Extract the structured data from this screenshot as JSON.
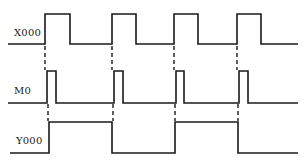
{
  "diagram": {
    "type": "timing-diagram",
    "colors": {
      "line": "#1a1a1a",
      "background": "#ffffff"
    },
    "signals": [
      {
        "name": "X000",
        "label_pos": [
          14,
          34
        ],
        "low_y": 44,
        "high_y": 14,
        "path": [
          [
            8,
            44
          ],
          [
            45,
            44
          ],
          [
            45,
            14
          ],
          [
            70,
            14
          ],
          [
            70,
            44
          ],
          [
            112,
            44
          ],
          [
            112,
            14
          ],
          [
            136,
            14
          ],
          [
            136,
            44
          ],
          [
            174,
            44
          ],
          [
            174,
            14
          ],
          [
            198,
            14
          ],
          [
            198,
            44
          ],
          [
            237,
            44
          ],
          [
            237,
            14
          ],
          [
            261,
            14
          ],
          [
            261,
            44
          ],
          [
            298,
            44
          ]
        ]
      },
      {
        "name": "M0",
        "label_pos": [
          14,
          92
        ],
        "low_y": 103,
        "high_y": 71,
        "path": [
          [
            8,
            103
          ],
          [
            47,
            103
          ],
          [
            47,
            71
          ],
          [
            56,
            71
          ],
          [
            56,
            103
          ],
          [
            114,
            103
          ],
          [
            114,
            71
          ],
          [
            123,
            71
          ],
          [
            123,
            103
          ],
          [
            176,
            103
          ],
          [
            176,
            71
          ],
          [
            184,
            71
          ],
          [
            184,
            103
          ],
          [
            239,
            103
          ],
          [
            239,
            71
          ],
          [
            248,
            71
          ],
          [
            248,
            103
          ],
          [
            298,
            103
          ]
        ]
      },
      {
        "name": "Y000",
        "label_pos": [
          16,
          142
        ],
        "low_y": 153,
        "high_y": 122,
        "path": [
          [
            10,
            153
          ],
          [
            49,
            153
          ],
          [
            49,
            122
          ],
          [
            112,
            122
          ],
          [
            112,
            153
          ],
          [
            175,
            153
          ],
          [
            175,
            122
          ],
          [
            238,
            122
          ],
          [
            238,
            153
          ],
          [
            298,
            153
          ]
        ]
      }
    ],
    "dashed_guides": [
      {
        "x": 45,
        "y1": 46,
        "y2": 70
      },
      {
        "x": 112,
        "y1": 46,
        "y2": 70
      },
      {
        "x": 174,
        "y1": 46,
        "y2": 70
      },
      {
        "x": 237,
        "y1": 46,
        "y2": 70
      },
      {
        "x": 48,
        "y1": 104,
        "y2": 121
      },
      {
        "x": 113,
        "y1": 104,
        "y2": 121
      },
      {
        "x": 175,
        "y1": 104,
        "y2": 121
      },
      {
        "x": 238,
        "y1": 104,
        "y2": 121
      }
    ]
  }
}
